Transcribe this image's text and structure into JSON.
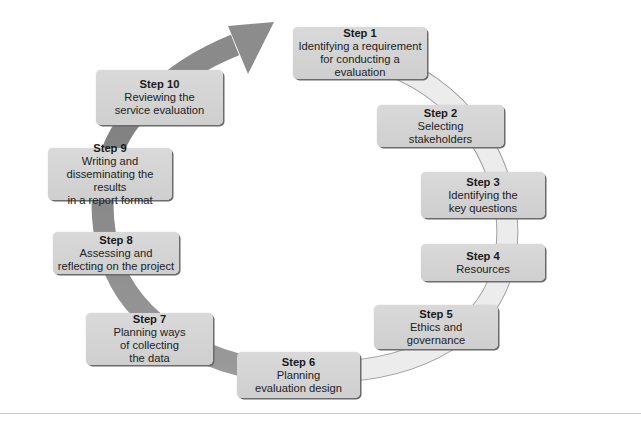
{
  "top_text_partial": "conceptually, the service evaluation cycle (9 steps)",
  "diagram": {
    "type": "cycle",
    "direction": "clockwise",
    "arrow_color_light": "#e4e4e4",
    "arrow_color_dark": "#8c8c8c",
    "box_fill": "#d4d4d4",
    "steps": [
      {
        "title": "Step 1",
        "lines": [
          "Identifying a requirement",
          "for conducting a",
          "evaluation"
        ]
      },
      {
        "title": "Step 2",
        "lines": [
          "Selecting",
          "stakeholders"
        ]
      },
      {
        "title": "Step 3",
        "lines": [
          "Identifying the",
          "key questions"
        ]
      },
      {
        "title": "Step 4",
        "lines": [
          "Resources"
        ]
      },
      {
        "title": "Step 5",
        "lines": [
          "Ethics and",
          "governance"
        ]
      },
      {
        "title": "Step 6",
        "lines": [
          "Planning",
          "evaluation design"
        ]
      },
      {
        "title": "Step 7",
        "lines": [
          "Planning ways",
          "of collecting",
          "the data"
        ]
      },
      {
        "title": "Step 8",
        "lines": [
          "Assessing and",
          "reflecting on the project"
        ]
      },
      {
        "title": "Step 9",
        "lines": [
          "Writing and",
          "disseminating the results",
          "in a report format"
        ]
      },
      {
        "title": "Step 10",
        "lines": [
          "Reviewing the",
          "service evaluation"
        ]
      }
    ]
  }
}
